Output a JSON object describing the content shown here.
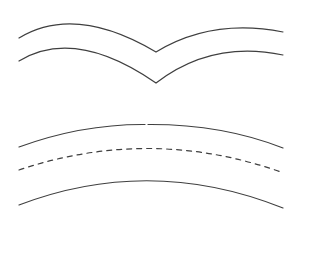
{
  "diagram": {
    "background": "#ffffff",
    "stroke_color": "#3f3f3f",
    "shapes": [
      {
        "id": "wing-upper",
        "style": "solid",
        "d": "M19,38 Q75,4 156,52 Q212,18 283,32"
      },
      {
        "id": "wing-lower",
        "style": "solid",
        "d": "M19,61 Q75,27 156,83 Q212,40 283,55"
      },
      {
        "id": "arc-top-left",
        "style": "solid",
        "d": "M19,147 Q82,124 145,124.5"
      },
      {
        "id": "arc-top-right",
        "style": "solid",
        "d": "M148,124.5 Q222,124 283,148"
      },
      {
        "id": "arc-middle-dashed",
        "style": "dashed",
        "d": "M19,170 Q150,126 281,172"
      },
      {
        "id": "arc-bottom",
        "style": "solid",
        "d": "M19,205 Q150,155 283,208"
      }
    ]
  }
}
